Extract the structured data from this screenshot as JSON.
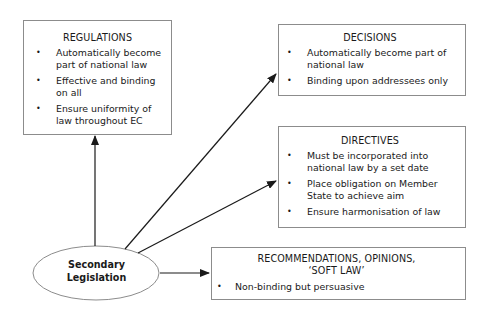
{
  "central_node": {
    "line1": "Secondary",
    "line2": "Legislation"
  },
  "regulations": {
    "title": "REGULATIONS",
    "items": [
      "Automatically become part of national law",
      "Effective and binding on all",
      "Ensure uniformity of law throughout EC"
    ]
  },
  "decisions": {
    "title": "DECISIONS",
    "items": [
      "Automatically become part of national law",
      "Binding upon addressees only"
    ]
  },
  "directives": {
    "title": "DIRECTIVES",
    "items": [
      "Must be incorporated into national law by a set date",
      "Place obligation on Member State to achieve aim",
      "Ensure harmonisation of law"
    ]
  },
  "recommendations": {
    "title_line1": "RECOMMENDATIONS, OPINIONS,",
    "title_line2": "‘SOFT LAW’",
    "items": [
      "Non-binding but persuasive"
    ]
  },
  "colors": {
    "line": "#1a1a1a",
    "border": "#8c8c8c",
    "background": "#ffffff"
  }
}
